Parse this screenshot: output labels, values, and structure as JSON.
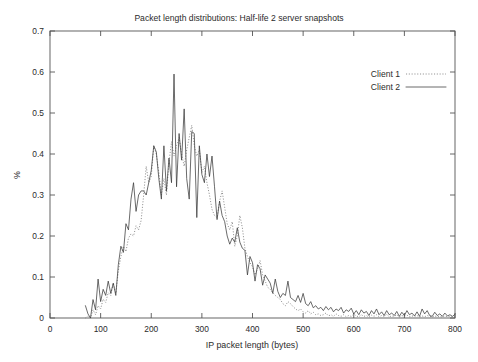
{
  "chart_data": {
    "type": "line",
    "title": "Packet length distributions: Half-life 2 server snapshots",
    "xlabel": "IP packet length (bytes)",
    "ylabel": "%",
    "xlim": [
      0,
      800
    ],
    "ylim": [
      0,
      0.7
    ],
    "grid": false,
    "legend_position": "top-right",
    "xticks": [
      "0",
      "100",
      "200",
      "300",
      "400",
      "500",
      "600",
      "700",
      "800"
    ],
    "xtick_values": [
      0,
      100,
      200,
      300,
      400,
      500,
      600,
      700,
      800
    ],
    "yticks": [
      "0",
      "0.1",
      "0.2",
      "0.3",
      "0.4",
      "0.5",
      "0.6",
      "0.7"
    ],
    "ytick_values": [
      0,
      0.1,
      0.2,
      0.3,
      0.4,
      0.5,
      0.6,
      0.7
    ],
    "x_step": 5,
    "x_start": 70,
    "series": [
      {
        "name": "Client 1",
        "style": "dotted",
        "color": "#6e6e6e",
        "values": [
          0.0,
          0.005,
          0.0,
          0.02,
          0.008,
          0.03,
          0.022,
          0.046,
          0.038,
          0.062,
          0.055,
          0.085,
          0.06,
          0.115,
          0.15,
          0.175,
          0.162,
          0.195,
          0.205,
          0.2,
          0.225,
          0.215,
          0.238,
          0.3,
          0.37,
          0.33,
          0.345,
          0.42,
          0.4,
          0.355,
          0.3,
          0.34,
          0.3,
          0.38,
          0.43,
          0.395,
          0.42,
          0.44,
          0.4,
          0.37,
          0.41,
          0.44,
          0.47,
          0.42,
          0.395,
          0.41,
          0.355,
          0.37,
          0.33,
          0.3,
          0.265,
          0.25,
          0.245,
          0.285,
          0.31,
          0.27,
          0.23,
          0.215,
          0.235,
          0.175,
          0.2,
          0.25,
          0.22,
          0.17,
          0.15,
          0.135,
          0.125,
          0.105,
          0.12,
          0.14,
          0.105,
          0.09,
          0.075,
          0.07,
          0.062,
          0.055,
          0.05,
          0.045,
          0.035,
          0.03,
          0.04,
          0.035,
          0.028,
          0.022,
          0.018,
          0.022,
          0.015,
          0.012,
          0.018,
          0.01,
          0.014,
          0.008,
          0.01,
          0.006,
          0.008,
          0.012,
          0.005,
          0.008,
          0.004,
          0.01,
          0.006,
          0.004,
          0.008,
          0.003,
          0.006,
          0.004,
          0.01,
          0.005,
          0.003,
          0.008,
          0.004,
          0.006,
          0.002,
          0.007,
          0.004,
          0.008,
          0.003,
          0.006,
          0.004,
          0.009,
          0.003,
          0.005,
          0.004,
          0.008,
          0.002,
          0.006,
          0.004,
          0.007,
          0.003,
          0.005,
          0.004,
          0.006,
          0.002,
          0.005,
          0.003,
          0.006,
          0.004,
          0.002,
          0.005,
          0.003,
          0.004,
          0.002,
          0.005,
          0.003,
          0.004,
          0.002,
          0.003
        ]
      },
      {
        "name": "Client 2",
        "style": "solid",
        "color": "#3a3a3a",
        "values": [
          0.03,
          0.01,
          0.0,
          0.045,
          0.02,
          0.095,
          0.04,
          0.07,
          0.055,
          0.09,
          0.06,
          0.085,
          0.055,
          0.13,
          0.175,
          0.16,
          0.23,
          0.215,
          0.29,
          0.33,
          0.26,
          0.3,
          0.31,
          0.31,
          0.3,
          0.33,
          0.36,
          0.42,
          0.405,
          0.34,
          0.29,
          0.42,
          0.31,
          0.39,
          0.33,
          0.595,
          0.32,
          0.45,
          0.385,
          0.51,
          0.34,
          0.29,
          0.455,
          0.45,
          0.245,
          0.42,
          0.35,
          0.33,
          0.4,
          0.345,
          0.395,
          0.32,
          0.24,
          0.285,
          0.25,
          0.235,
          0.2,
          0.18,
          0.195,
          0.185,
          0.22,
          0.185,
          0.17,
          0.165,
          0.105,
          0.15,
          0.135,
          0.09,
          0.13,
          0.12,
          0.08,
          0.105,
          0.095,
          0.085,
          0.06,
          0.095,
          0.065,
          0.05,
          0.06,
          0.055,
          0.09,
          0.05,
          0.045,
          0.04,
          0.055,
          0.038,
          0.06,
          0.035,
          0.03,
          0.04,
          0.025,
          0.03,
          0.022,
          0.026,
          0.018,
          0.028,
          0.02,
          0.026,
          0.015,
          0.022,
          0.018,
          0.026,
          0.012,
          0.02,
          0.016,
          0.024,
          0.01,
          0.018,
          0.008,
          0.02,
          0.012,
          0.016,
          0.006,
          0.018,
          0.01,
          0.022,
          0.008,
          0.015,
          0.006,
          0.018,
          0.008,
          0.012,
          0.006,
          0.016,
          0.004,
          0.014,
          0.006,
          0.018,
          0.008,
          0.012,
          0.005,
          0.015,
          0.004,
          0.022,
          0.01,
          0.018,
          0.006,
          0.004,
          0.014,
          0.006,
          0.01,
          0.004,
          0.012,
          0.005,
          0.008,
          0.004,
          0.009
        ]
      }
    ]
  },
  "legend": {
    "entries": [
      {
        "label": "Client 1"
      },
      {
        "label": "Client 2"
      }
    ]
  }
}
